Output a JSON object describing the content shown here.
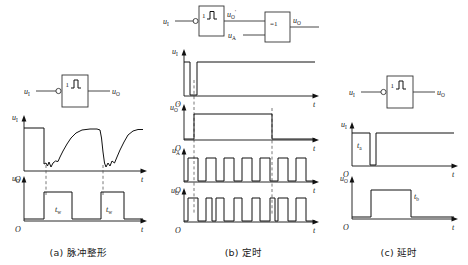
{
  "figure": {
    "panels": [
      {
        "id": "a",
        "caption": "(a) 脉冲整形",
        "circuit": {
          "input_label": "u",
          "input_sub": "I",
          "output_label": "u",
          "output_sub": "O",
          "gate_symbol": "1",
          "gate_icon": "schmitt-trigger-hysteresis-icon",
          "inverting_bubble": true
        },
        "waveforms": [
          {
            "name": "input",
            "ylabel": "u",
            "ysub": "I",
            "xlabel": "t",
            "origin": "O",
            "description": "noisy analog signal: high level, two noisy dips toward zero",
            "annotations": []
          },
          {
            "name": "output",
            "ylabel": "u",
            "ysub": "O",
            "xlabel": "t",
            "origin": "O",
            "description": "two rectangular output pulses",
            "annotations": [
              {
                "text": "t",
                "sub": "w"
              },
              {
                "text": "t",
                "sub": "w"
              }
            ]
          }
        ]
      },
      {
        "id": "b",
        "caption": "(b) 定时",
        "circuit": {
          "input_label": "u",
          "input_sub": "I",
          "mid_label": "u",
          "mid_sub": "O",
          "mid_prime": "'",
          "second_input_label": "u",
          "second_input_sub": "A",
          "output_label": "u",
          "output_sub": "O",
          "gate1_symbol": "1",
          "gate1_icon": "schmitt-trigger-hysteresis-icon",
          "gate2_symbol": "=1",
          "gate2_icon": "xor-gate-icon",
          "inverting_bubble": true
        },
        "waveforms": [
          {
            "name": "input",
            "ylabel": "u",
            "ysub": "I",
            "xlabel": "t",
            "origin": "O",
            "description": "high level with one narrow negative-going pulse"
          },
          {
            "name": "mid-output",
            "ylabel": "u",
            "ysub": "O",
            "prime": "'",
            "xlabel": "t",
            "origin": "O",
            "description": "single wide positive gate pulse (timing window)"
          },
          {
            "name": "clock-input",
            "ylabel": "u",
            "ysub": "A",
            "xlabel": "t",
            "origin": "O",
            "description": "continuous rectangular clock pulse train, 8 pulses"
          },
          {
            "name": "output",
            "ylabel": "u",
            "ysub": "O",
            "xlabel": "t",
            "origin": "O",
            "description": "clock train XORed with gate window: pulses inverted inside window"
          }
        ]
      },
      {
        "id": "c",
        "caption": "(c) 延时",
        "circuit": {
          "input_label": "u",
          "input_sub": "I",
          "output_label": "u",
          "output_sub": "O",
          "gate_symbol": "1",
          "gate_icon": "schmitt-trigger-hysteresis-icon",
          "inverting_bubble": true
        },
        "waveforms": [
          {
            "name": "input",
            "ylabel": "u",
            "ysub": "I",
            "xlabel": "t",
            "origin": "O",
            "description": "high level, falls to zero briefly then returns high",
            "annotations": [
              {
                "text": "t",
                "sub": "a"
              }
            ]
          },
          {
            "name": "output",
            "ylabel": "u",
            "ysub": "O",
            "xlabel": "t",
            "origin": "O",
            "description": "delayed rectangular pulse",
            "annotations": [
              {
                "text": "t",
                "sub": "b"
              }
            ]
          }
        ]
      }
    ]
  },
  "colors": {
    "line": "#111111",
    "gate": "#333333",
    "dashed": "#555555",
    "background": "#ffffff"
  }
}
